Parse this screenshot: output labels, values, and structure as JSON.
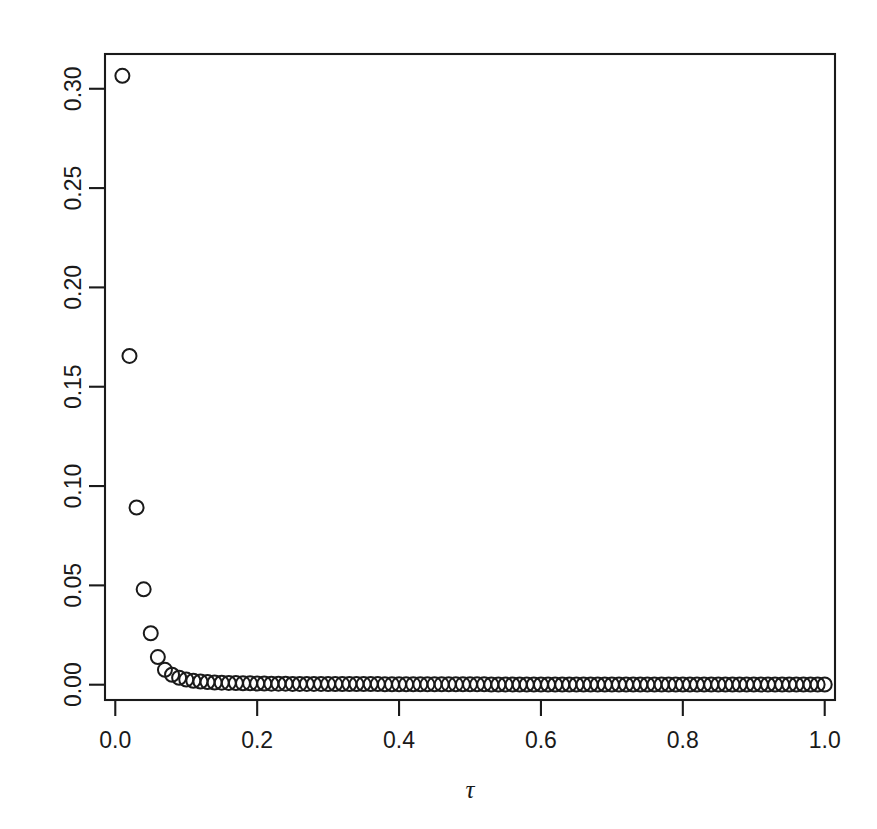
{
  "figure": {
    "background_color": "#ffffff",
    "foreground_color": "#1a1a1a",
    "width": 877,
    "height": 829
  },
  "chart_data": {
    "type": "scatter",
    "title": "",
    "subtitle": "",
    "xlabel": "τ",
    "ylabel": "",
    "xlim": [
      -0.0145,
      1.0145
    ],
    "ylim": [
      -0.0077,
      0.3175
    ],
    "grid": false,
    "legend": null,
    "point_symbol": "open-circle",
    "point_radius_px": 7,
    "x_ticks": [
      0.0,
      0.2,
      0.4,
      0.6,
      0.8,
      1.0
    ],
    "x_tick_labels": [
      "0.0",
      "0.2",
      "0.4",
      "0.6",
      "0.8",
      "1.0"
    ],
    "y_ticks": [
      0.0,
      0.05,
      0.1,
      0.15,
      0.2,
      0.25,
      0.3
    ],
    "y_tick_labels": [
      "0.00",
      "0.05",
      "0.10",
      "0.15",
      "0.20",
      "0.25",
      "0.30"
    ],
    "x": [
      0.01,
      0.02,
      0.03,
      0.04,
      0.05,
      0.06,
      0.07,
      0.08,
      0.09,
      0.1,
      0.11,
      0.12,
      0.13,
      0.14,
      0.15,
      0.16,
      0.17,
      0.18,
      0.19,
      0.2,
      0.21,
      0.22,
      0.23,
      0.24,
      0.25,
      0.26,
      0.27,
      0.28,
      0.29,
      0.3,
      0.31,
      0.32,
      0.33,
      0.34,
      0.35,
      0.36,
      0.37,
      0.38,
      0.39,
      0.4,
      0.41,
      0.42,
      0.43,
      0.44,
      0.45,
      0.46,
      0.47,
      0.48,
      0.49,
      0.5,
      0.51,
      0.52,
      0.53,
      0.54,
      0.55,
      0.56,
      0.57,
      0.58,
      0.59,
      0.6,
      0.61,
      0.62,
      0.63,
      0.64,
      0.65,
      0.66,
      0.67,
      0.68,
      0.69,
      0.7,
      0.71,
      0.72,
      0.73,
      0.74,
      0.75,
      0.76,
      0.77,
      0.78,
      0.79,
      0.8,
      0.81,
      0.82,
      0.83,
      0.84,
      0.85,
      0.86,
      0.87,
      0.88,
      0.89,
      0.9,
      0.91,
      0.92,
      0.93,
      0.94,
      0.95,
      0.96,
      0.97,
      0.98,
      0.99,
      1.0
    ],
    "y": [
      0.3065,
      0.1655,
      0.0892,
      0.048,
      0.0259,
      0.0139,
      0.0075,
      0.005,
      0.0035,
      0.0026,
      0.002,
      0.0016,
      0.0013,
      0.0011,
      0.001,
      0.0009,
      0.0008,
      0.0007,
      0.0007,
      0.0006,
      0.0006,
      0.0005,
      0.0005,
      0.0005,
      0.0004,
      0.0004,
      0.0004,
      0.0004,
      0.0004,
      0.0003,
      0.0003,
      0.0003,
      0.0003,
      0.0003,
      0.0003,
      0.0003,
      0.0003,
      0.0002,
      0.0002,
      0.0002,
      0.0002,
      0.0002,
      0.0002,
      0.0002,
      0.0002,
      0.0002,
      0.0002,
      0.0002,
      0.0002,
      0.0002,
      0.0002,
      0.0002,
      0.0001,
      0.0001,
      0.0001,
      0.0001,
      0.0001,
      0.0001,
      0.0001,
      0.0001,
      0.0001,
      0.0001,
      0.0001,
      0.0001,
      0.0001,
      0.0001,
      0.0001,
      0.0001,
      0.0001,
      0.0001,
      0.0001,
      0.0001,
      0.0001,
      0.0001,
      0.0001,
      0.0001,
      0.0001,
      0.0001,
      0.0001,
      0.0001,
      0.0001,
      0.0001,
      0.0001,
      0.0001,
      0.0001,
      0.0001,
      0.0001,
      0.0001,
      0.0001,
      0.0001,
      0.0001,
      0.0001,
      0.0001,
      0.0001,
      0.0001,
      0.0001,
      0.0001,
      0.0001,
      0.0001,
      0.0001
    ]
  }
}
